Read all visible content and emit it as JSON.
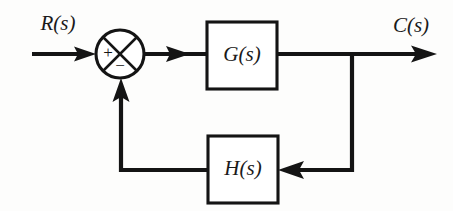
{
  "diagram": {
    "type": "block-diagram",
    "domain": "control-systems",
    "background_color": "#fdfdfc",
    "line_color": "#141414",
    "canvas": {
      "width": 453,
      "height": 211
    },
    "signals": {
      "input_label": "R(s)",
      "output_label": "C(s)"
    },
    "blocks": [
      {
        "id": "forward",
        "label": "G(s)",
        "role": "forward-path-transfer-function",
        "x": 207,
        "y": 22,
        "width": 70,
        "height": 67
      },
      {
        "id": "feedback",
        "label": "H(s)",
        "role": "feedback-path-transfer-function",
        "x": 208,
        "y": 136,
        "width": 70,
        "height": 67
      }
    ],
    "summing_junction": {
      "label": "summing-junction",
      "center_x": 120,
      "center_y": 54,
      "radius": 24,
      "positive_sign": "+",
      "negative_sign": "−",
      "positive_input": "R(s)",
      "negative_input": "H(s) feedback"
    },
    "connections": [
      {
        "from": "R(s) input",
        "to": "summing junction",
        "arrow": true
      },
      {
        "from": "summing junction",
        "to": "G(s)",
        "arrow": true
      },
      {
        "from": "G(s)",
        "to": "C(s) output",
        "arrow": true
      },
      {
        "from": "output tap",
        "to": "H(s)",
        "arrow": true
      },
      {
        "from": "H(s)",
        "to": "summing junction",
        "arrow": true
      }
    ]
  }
}
